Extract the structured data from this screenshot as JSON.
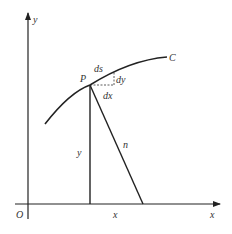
{
  "diagram": {
    "colors": {
      "stroke": "#222222",
      "label": "#333333",
      "background": "#ffffff"
    },
    "axes": {
      "x_label": "x",
      "y_label": "y",
      "origin_label": "O"
    },
    "curve": {
      "label": "C"
    },
    "point": {
      "label": "P"
    },
    "differentials": {
      "ds": "ds",
      "dx": "dx",
      "dy": "dy"
    },
    "segments": {
      "ordinate_label": "y",
      "normal_label": "n",
      "abscissa_label": "x"
    }
  }
}
